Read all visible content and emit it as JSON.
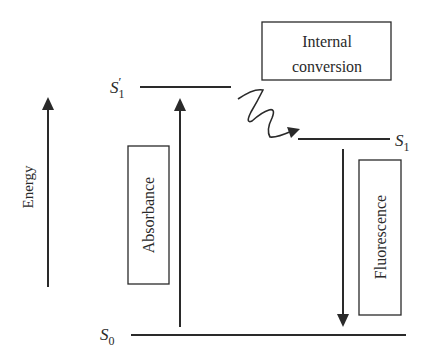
{
  "diagram": {
    "type": "jablonski-energy-diagram",
    "axis": {
      "label": "Energy"
    },
    "levels": [
      {
        "id": "S1prime",
        "symbol": "S",
        "subscript": "1",
        "prime": "′"
      },
      {
        "id": "S1",
        "symbol": "S",
        "subscript": "1"
      },
      {
        "id": "S0",
        "symbol": "S",
        "subscript": "0"
      }
    ],
    "processes": {
      "absorbance": {
        "label": "Absorbance",
        "from": "S0",
        "to": "S1prime"
      },
      "internal_conversion": {
        "line1": "Internal",
        "line2": "conversion",
        "from": "S1prime",
        "to": "S1"
      },
      "fluorescence": {
        "label": "Fluorescence",
        "from": "S1",
        "to": "S0"
      }
    },
    "colors": {
      "stroke": "#2a2a2a",
      "background": "#ffffff"
    }
  }
}
